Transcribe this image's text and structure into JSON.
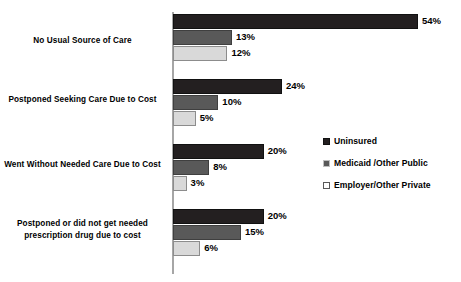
{
  "chart_data": {
    "type": "bar",
    "orientation": "horizontal",
    "title": "",
    "subtitle": "",
    "xlabel": "",
    "ylabel": "",
    "grid": false,
    "xlim": [
      0,
      54
    ],
    "axis_visible": true,
    "legend_position": "right",
    "categories": [
      "No Usual Source of Care",
      "Postponed Seeking Care Due to Cost",
      "Went Without Needed Care Due to Cost",
      "Postponed or did not get needed prescription drug due to cost"
    ],
    "series": [
      {
        "name": "Uninsured",
        "color": "#231f20",
        "values": [
          54,
          24,
          20,
          20
        ],
        "labels": [
          "54%",
          "24%",
          "20%",
          "20%"
        ]
      },
      {
        "name": "Medicaid /Other Public",
        "color": "#595959",
        "values": [
          13,
          10,
          8,
          15
        ],
        "labels": [
          "13%",
          "10%",
          "8%",
          "15%"
        ]
      },
      {
        "name": "Employer/Other Private",
        "color": "#d9d9d9",
        "values": [
          12,
          5,
          3,
          6
        ],
        "labels": [
          "12%",
          "5%",
          "3%",
          "6%"
        ]
      }
    ]
  },
  "legend": {
    "items": [
      {
        "label": "Uninsured"
      },
      {
        "label": "Medicaid /Other Public"
      },
      {
        "label": "Employer/Other Private"
      }
    ]
  },
  "groups": [
    {
      "label": "No Usual Source of Care",
      "bars": [
        {
          "value": 54,
          "label": "54%"
        },
        {
          "value": 13,
          "label": "13%"
        },
        {
          "value": 12,
          "label": "12%"
        }
      ]
    },
    {
      "label": "Postponed Seeking Care Due to Cost",
      "bars": [
        {
          "value": 24,
          "label": "24%"
        },
        {
          "value": 10,
          "label": "10%"
        },
        {
          "value": 5,
          "label": "5%"
        }
      ]
    },
    {
      "label": "Went Without Needed Care Due to Cost",
      "bars": [
        {
          "value": 20,
          "label": "20%"
        },
        {
          "value": 8,
          "label": "8%"
        },
        {
          "value": 3,
          "label": "3%"
        }
      ]
    },
    {
      "label": "Postponed or did not get needed prescription drug due to cost",
      "bars": [
        {
          "value": 20,
          "label": "20%"
        },
        {
          "value": 15,
          "label": "15%"
        },
        {
          "value": 6,
          "label": "6%"
        }
      ]
    }
  ]
}
